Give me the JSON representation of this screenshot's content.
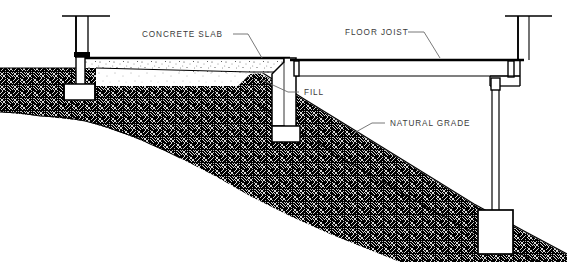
{
  "diagram": {
    "type": "architectural-section",
    "background_color": "#ffffff",
    "line_color": "#000000",
    "label_color": "#3b3b3b",
    "labels": [
      {
        "id": "concrete-slab",
        "text": "CONCRETE SLAB",
        "x": 142,
        "y": 37
      },
      {
        "id": "floor-joist",
        "text": "FLOOR JOIST",
        "x": 345,
        "y": 35
      },
      {
        "id": "fill",
        "text": "FILL",
        "x": 304,
        "y": 95
      },
      {
        "id": "natural-grade",
        "text": "NATURAL GRADE",
        "x": 390,
        "y": 126
      }
    ],
    "components": [
      {
        "id": "left-wall",
        "name": "Left foundation wall with footing"
      },
      {
        "id": "concrete-slab-body",
        "name": "Concrete slab on fill"
      },
      {
        "id": "fill-body",
        "name": "Compacted fill under slab"
      },
      {
        "id": "stepped-foundation",
        "name": "Stepped center foundation wall"
      },
      {
        "id": "floor-joist-beam",
        "name": "Floor joist / girder span"
      },
      {
        "id": "right-pier",
        "name": "Right pier post"
      },
      {
        "id": "pier-footing",
        "name": "Pier spread footing"
      },
      {
        "id": "natural-grade-soil",
        "name": "Natural grade sloping soil"
      }
    ]
  }
}
